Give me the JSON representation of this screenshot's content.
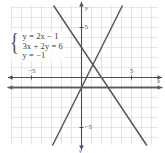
{
  "figure": {
    "kind": "coordinate-plane-graph",
    "background_color": "#ffffff",
    "grid_color": "#c9cdd2",
    "axis_color": "#4d4d4d",
    "line_color": "#595959"
  },
  "equation_box": {
    "brace": "{",
    "equations": [
      "y = 2x − 1",
      "3x + 2y = 6",
      "y = −1"
    ]
  },
  "axes": {
    "x_label": "x",
    "y_label_top": "y",
    "y_label_bottom": "y",
    "x_tick_positive": "5",
    "x_tick_negative": "−5",
    "y_tick_positive": "5",
    "y_tick_negative": "−5"
  },
  "chart_data": {
    "type": "line",
    "title": "",
    "xlabel": "x",
    "ylabel": "y",
    "xlim": [
      -7.5,
      8.5
    ],
    "ylim": [
      -7.5,
      7.5
    ],
    "grid": true,
    "grid_step": 1,
    "legend": "none",
    "series": [
      {
        "name": "y = 2x − 1",
        "equation": "y = 2x - 1",
        "slope": 2,
        "intercept": -1,
        "color": "#595959"
      },
      {
        "name": "3x + 2y = 6",
        "equation": "3x + 2y = 6",
        "slope": -1.5,
        "intercept": 3,
        "color": "#595959"
      },
      {
        "name": "y = −1",
        "equation": "y = -1",
        "slope": 0,
        "intercept": -1,
        "color": "#595959"
      }
    ]
  }
}
